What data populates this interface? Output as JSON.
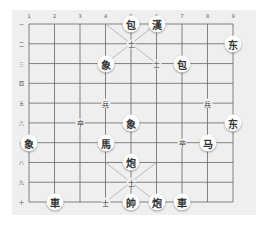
{
  "board": {
    "file_labels": [
      "1",
      "2",
      "3",
      "4",
      "5",
      "6",
      "7",
      "8",
      "9"
    ],
    "rank_labels": [
      "一",
      "二",
      "三",
      "四",
      "五",
      "六",
      "七",
      "八",
      "九",
      "十"
    ],
    "colors": {
      "background": "#efefef",
      "lines": "#666666",
      "piece": "#ffffff",
      "text": "#333333"
    }
  },
  "pieces": [
    {
      "char": "包",
      "file": 5,
      "rank": 1,
      "size": "big"
    },
    {
      "char": "漢",
      "file": 6,
      "rank": 1,
      "size": "big"
    },
    {
      "char": "士",
      "file": 5,
      "rank": 2,
      "size": "small"
    },
    {
      "char": "东",
      "file": 9,
      "rank": 2,
      "size": "big"
    },
    {
      "char": "象",
      "file": 4,
      "rank": 3,
      "size": "big"
    },
    {
      "char": "士",
      "file": 6,
      "rank": 3,
      "size": "small"
    },
    {
      "char": "包",
      "file": 7,
      "rank": 3,
      "size": "big"
    },
    {
      "char": "兵",
      "file": 4,
      "rank": 5,
      "size": "small"
    },
    {
      "char": "兵",
      "file": 8,
      "rank": 5,
      "size": "small"
    },
    {
      "char": "卒",
      "file": 3,
      "rank": 6,
      "size": "small"
    },
    {
      "char": "象",
      "file": 5,
      "rank": 6,
      "size": "big"
    },
    {
      "char": "东",
      "file": 9,
      "rank": 6,
      "size": "big"
    },
    {
      "char": "象",
      "file": 1,
      "rank": 7,
      "size": "big"
    },
    {
      "char": "馬",
      "file": 4,
      "rank": 7,
      "size": "big"
    },
    {
      "char": "卒",
      "file": 7,
      "rank": 7,
      "size": "small"
    },
    {
      "char": "马",
      "file": 8,
      "rank": 7,
      "size": "big"
    },
    {
      "char": "炮",
      "file": 5,
      "rank": 8,
      "size": "big"
    },
    {
      "char": "士",
      "file": 5,
      "rank": 9,
      "size": "small"
    },
    {
      "char": "車",
      "file": 2,
      "rank": 10,
      "size": "big"
    },
    {
      "char": "士",
      "file": 4,
      "rank": 10,
      "size": "small"
    },
    {
      "char": "帥",
      "file": 5,
      "rank": 10,
      "size": "big"
    },
    {
      "char": "炮",
      "file": 6,
      "rank": 10,
      "size": "big"
    },
    {
      "char": "車",
      "file": 7,
      "rank": 10,
      "size": "big"
    }
  ]
}
